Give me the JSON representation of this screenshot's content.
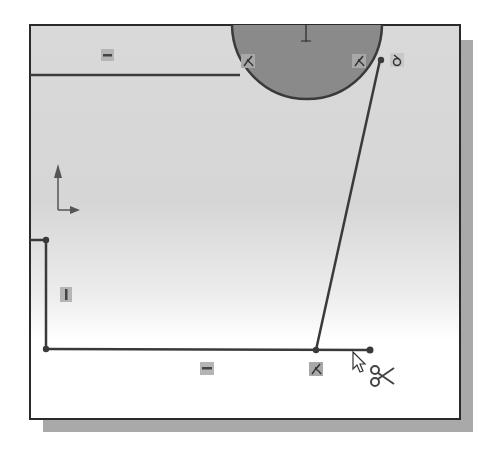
{
  "app": {
    "title": "Sketch Trim Tool - Power Trim",
    "tool_active": "trim",
    "cursor_mode": "trim-scissors"
  },
  "colors": {
    "background_top": "#d8d8d8",
    "background_bottom": "#ffffff",
    "sketch_line": "#3a3a3a",
    "circle_fill": "#8a8a8a",
    "circle_outline": "#3a3a3a",
    "frame_border": "#2a2a2a",
    "shadow": "#a9a9a9",
    "relation_icon_bg": "#b5b5b5",
    "relation_icon_glyph": "#444444"
  },
  "sketch": {
    "circle": {
      "cx": 307,
      "cy": 24,
      "r": 75,
      "label": "circle"
    },
    "center_mark": {
      "x": 306,
      "y": 24,
      "label": "circle-center-point"
    },
    "lines": [
      {
        "id": "top-horizontal-line",
        "x1": 29,
        "y1": 75,
        "x2": 240,
        "y2": 75
      },
      {
        "id": "left-stub-line",
        "x1": 29,
        "y1": 240,
        "x2": 46,
        "y2": 240
      },
      {
        "id": "left-vertical-line",
        "x1": 46,
        "y1": 240,
        "x2": 46,
        "y2": 349
      },
      {
        "id": "bottom-horizontal-line",
        "x1": 46,
        "y1": 349,
        "x2": 370,
        "y2": 350
      },
      {
        "id": "slanted-line",
        "x1": 380,
        "y1": 60,
        "x2": 316,
        "y2": 350
      }
    ],
    "points": [
      {
        "id": "point-left-top",
        "x": 46,
        "y": 240
      },
      {
        "id": "point-left-bottom",
        "x": 46,
        "y": 349
      },
      {
        "id": "point-slant-bottom",
        "x": 316,
        "y": 350
      },
      {
        "id": "point-bottom-end",
        "x": 370,
        "y": 350
      },
      {
        "id": "point-slant-top",
        "x": 380,
        "y": 60
      }
    ],
    "relations": [
      {
        "id": "relation-horizontal-top",
        "type": "horizontal",
        "x": 101,
        "y": 49,
        "icon": "horizontal-relation-icon"
      },
      {
        "id": "relation-tangent-left",
        "type": "tangent",
        "x": 241,
        "y": 54,
        "icon": "tangent-relation-icon"
      },
      {
        "id": "relation-tangent-right",
        "type": "tangent",
        "x": 352,
        "y": 54,
        "icon": "tangent-relation-icon"
      },
      {
        "id": "relation-coincident-right",
        "type": "coincident",
        "x": 390,
        "y": 53,
        "icon": "coincident-relation-icon"
      },
      {
        "id": "relation-vertical-left",
        "type": "vertical",
        "x": 60,
        "y": 287,
        "icon": "vertical-relation-icon"
      },
      {
        "id": "relation-horizontal-bottom",
        "type": "horizontal",
        "x": 200,
        "y": 362,
        "icon": "horizontal-relation-icon"
      },
      {
        "id": "relation-tangent-bottom",
        "type": "tangent",
        "x": 309,
        "y": 362,
        "icon": "tangent-relation-icon"
      }
    ],
    "origin_triad": {
      "x": 58,
      "y": 208,
      "label": "origin-axes"
    },
    "cursor": {
      "x": 353,
      "y": 352,
      "label": "trim-cursor"
    }
  }
}
